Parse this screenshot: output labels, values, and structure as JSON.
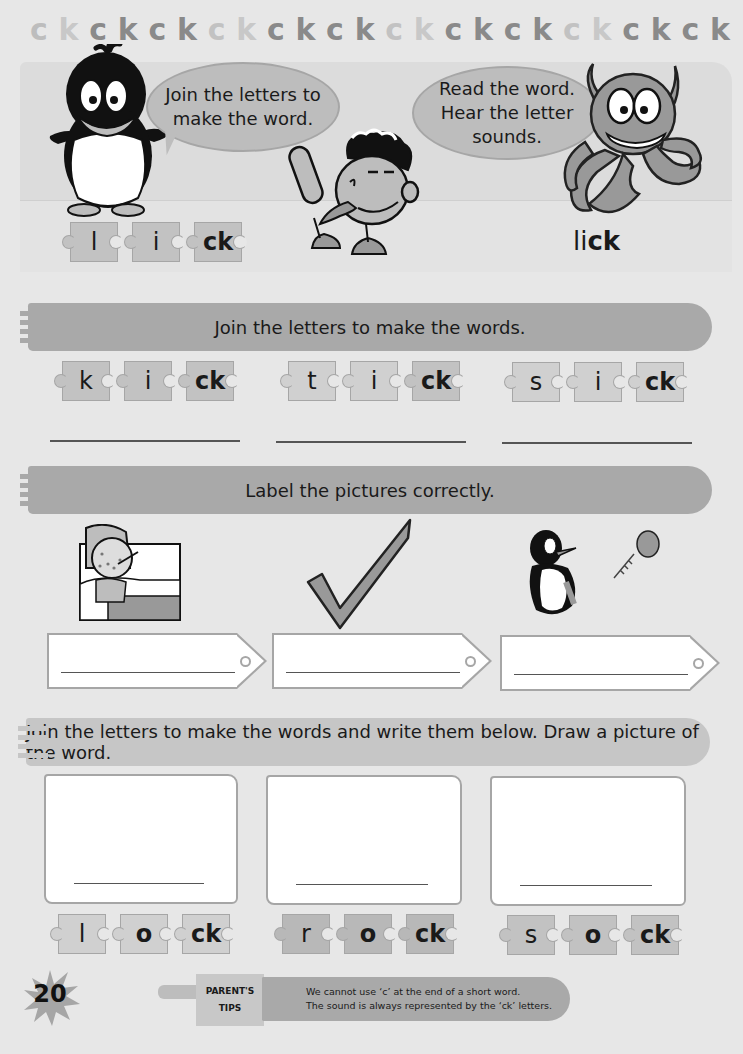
{
  "header": {
    "strip": [
      {
        "t": "c",
        "c": "#bdbdbd"
      },
      {
        "t": "k",
        "c": "#c8c8c8"
      },
      {
        "t": "c",
        "c": "#8a8a8a"
      },
      {
        "t": "k",
        "c": "#8a8a8a"
      },
      {
        "t": "c",
        "c": "#8a8a8a"
      },
      {
        "t": "k",
        "c": "#8a8a8a"
      },
      {
        "t": "c",
        "c": "#c2c2c2"
      },
      {
        "t": "k",
        "c": "#c8c8c8"
      },
      {
        "t": "c",
        "c": "#8a8a8a"
      },
      {
        "t": "k",
        "c": "#8a8a8a"
      },
      {
        "t": "c",
        "c": "#8a8a8a"
      },
      {
        "t": "k",
        "c": "#8a8a8a"
      },
      {
        "t": "c",
        "c": "#c2c2c2"
      },
      {
        "t": "k",
        "c": "#c8c8c8"
      },
      {
        "t": "c",
        "c": "#8a8a8a"
      },
      {
        "t": "k",
        "c": "#8a8a8a"
      },
      {
        "t": "c",
        "c": "#8a8a8a"
      },
      {
        "t": "k",
        "c": "#8a8a8a"
      },
      {
        "t": "c",
        "c": "#c2c2c2"
      },
      {
        "t": "k",
        "c": "#c8c8c8"
      },
      {
        "t": "c",
        "c": "#8a8a8a"
      },
      {
        "t": "k",
        "c": "#8a8a8a"
      },
      {
        "t": "c",
        "c": "#8a8a8a"
      },
      {
        "t": "k",
        "c": "#8a8a8a"
      }
    ]
  },
  "intro": {
    "bubble_left": "Join the letters to make the word.",
    "bubble_left_lines": [
      "Join the letters to",
      "make the word."
    ],
    "bubble_right_lines": [
      "Read the word.",
      "Hear the letter",
      "sounds."
    ],
    "pieces": [
      "l",
      "i",
      "ck"
    ],
    "word_plain": "li",
    "word_bold": "ck"
  },
  "section1": {
    "title": "Join the letters to make the words.",
    "groups": [
      {
        "pieces": [
          "k",
          "i",
          "ck"
        ]
      },
      {
        "pieces": [
          "t",
          "i",
          "ck"
        ]
      },
      {
        "pieces": [
          "s",
          "i",
          "ck"
        ]
      }
    ]
  },
  "section2": {
    "title": "Label the pictures correctly.",
    "pictures": [
      "sick-girl-in-bed",
      "tick-mark",
      "penguin-kicking-ball"
    ]
  },
  "section3": {
    "title": "Join the letters to make the words and write them below. Draw a picture of the word.",
    "groups": [
      {
        "pieces": [
          "l",
          "o",
          "ck"
        ]
      },
      {
        "pieces": [
          "r",
          "o",
          "ck"
        ]
      },
      {
        "pieces": [
          "s",
          "o",
          "ck"
        ]
      }
    ]
  },
  "footer": {
    "page_number": "20",
    "tips_label_1": "PARENT'S",
    "tips_label_2": "TIPS",
    "tips_line_1": "We cannot use ‘c’ at the end of a short word.",
    "tips_line_2": "The sound is always represented by the ‘ck’ letters."
  },
  "colors": {
    "page_bg": "#e7e7e7",
    "banner": "#a9a9a9",
    "banner_light": "#c6c6c6",
    "piece": "#c2c2c2",
    "bubble": "#bdbdbd",
    "outline": "#a6a6a6"
  }
}
